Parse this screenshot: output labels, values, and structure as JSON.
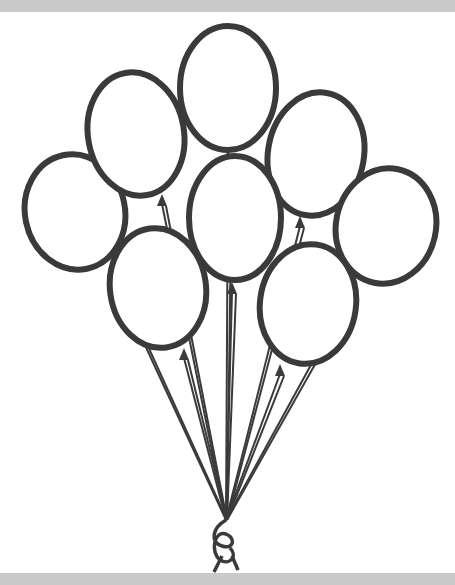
{
  "illustration": {
    "subject": "bunch of balloons line art",
    "colors": {
      "outline": "#3a3a3a",
      "fill": "#ffffff",
      "band": "#c9c9c9"
    },
    "knot": {
      "x": 226,
      "y": 520
    },
    "balloons": [
      {
        "id": "left-outer",
        "cx": 75,
        "cy": 212,
        "rx": 50,
        "ry": 58,
        "rot": -12,
        "tieX": 112,
        "tieY": 266
      },
      {
        "id": "upper-left",
        "cx": 136,
        "cy": 134,
        "rx": 48,
        "ry": 62,
        "rot": -10,
        "tieX": 162,
        "tieY": 196
      },
      {
        "id": "top-center",
        "cx": 228,
        "cy": 88,
        "rx": 48,
        "ry": 62,
        "rot": 0,
        "tieX": 228,
        "tieY": 152
      },
      {
        "id": "upper-right",
        "cx": 316,
        "cy": 154,
        "rx": 48,
        "ry": 62,
        "rot": 10,
        "tieX": 300,
        "tieY": 218
      },
      {
        "id": "right-outer",
        "cx": 386,
        "cy": 226,
        "rx": 50,
        "ry": 58,
        "rot": 12,
        "tieX": 352,
        "tieY": 282
      },
      {
        "id": "center",
        "cx": 235,
        "cy": 218,
        "rx": 46,
        "ry": 62,
        "rot": 0,
        "tieX": 232,
        "tieY": 284
      },
      {
        "id": "lower-left",
        "cx": 158,
        "cy": 288,
        "rx": 48,
        "ry": 60,
        "rot": -8,
        "tieX": 184,
        "tieY": 350
      },
      {
        "id": "lower-right",
        "cx": 308,
        "cy": 304,
        "rx": 48,
        "ry": 60,
        "rot": 8,
        "tieX": 280,
        "tieY": 366
      }
    ]
  }
}
